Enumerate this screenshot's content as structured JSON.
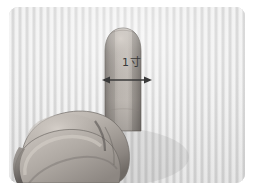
{
  "figure": {
    "kind": "photograph",
    "color_mode": "grayscale",
    "frame": {
      "outer_background": "#ffffff",
      "plate_corner_radius_px": 9,
      "plate_left_px": 9,
      "plate_top_px": 7,
      "plate_width_px": 236,
      "plate_height_px": 176
    },
    "background": {
      "description": "vertically striped light gray cloth backdrop",
      "base_color": "#dcdcdc",
      "stripe_light": "#ffffff",
      "stripe_dark": "#c4c4c4"
    },
    "skin": {
      "highlight": "#c9c3bd",
      "midtone": "#a8a29c",
      "shadow": "#837d78",
      "deep_shadow": "#5f5a56",
      "outline": "#6e6a66"
    }
  },
  "annotation": {
    "measurement_label": "1寸",
    "label_color": "#3a3a3a",
    "arrow": {
      "style": "double-headed",
      "color": "#3a3a3a",
      "orientation": "horizontal",
      "meaning": "width of the index finger"
    }
  }
}
